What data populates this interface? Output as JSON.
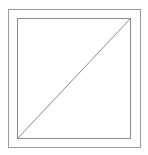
{
  "diagram": {
    "colors": {
      "background": "#ffffff",
      "outer_stroke": "#9a9a9a",
      "inner_stroke": "#8c8c8c",
      "diagonal_stroke": "#8a8a8a"
    },
    "outer_box": {
      "x": 8,
      "y": 9,
      "width": 132,
      "height": 138
    },
    "inner_box": {
      "x": 17,
      "y": 18,
      "width": 113,
      "height": 120
    },
    "diagonal": {
      "x1": 17,
      "y1": 138,
      "x2": 130,
      "y2": 18
    }
  }
}
